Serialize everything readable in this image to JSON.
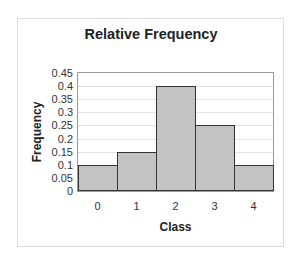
{
  "chart_data": {
    "type": "bar",
    "title": "Relative Frequency",
    "xlabel": "Class",
    "ylabel": "Frequency",
    "categories": [
      "0",
      "1",
      "2",
      "3",
      "4"
    ],
    "values": [
      0.1,
      0.15,
      0.4,
      0.25,
      0.1
    ],
    "ylim": [
      0,
      0.45
    ],
    "yticks": [
      "0",
      "0.05",
      "0.1",
      "0.15",
      "0.2",
      "0.25",
      "0.3",
      "0.35",
      "0.4",
      "0.45"
    ],
    "grid": true,
    "legend": null,
    "colors": {
      "bar_fill": "#c3c3c3",
      "bar_border": "#333333",
      "grid": "#e2e2e2"
    }
  }
}
